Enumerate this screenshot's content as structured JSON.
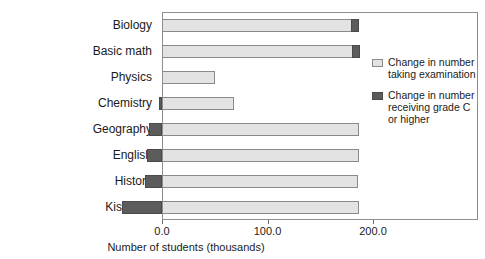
{
  "chart": {
    "type": "bar",
    "orientation": "horizontal",
    "title": "",
    "xlabel": "Number of students (thousands)",
    "ylabel": "",
    "xlim": [
      -45,
      200
    ],
    "xticks": [
      0.0,
      100.0,
      200.0
    ],
    "xtick_labels": [
      "0.0",
      "100.0",
      "200.0"
    ],
    "grid": false,
    "legend_position": "right",
    "categories": [
      "Biology",
      "Basic math",
      "Physics",
      "Chemistry",
      "Geography",
      "English",
      "History",
      "Kiswahili"
    ],
    "series": [
      {
        "name": "Change in number taking examination",
        "color": "#e3e3e3",
        "values": [
          187,
          188,
          50,
          68,
          187,
          187,
          186,
          187
        ]
      },
      {
        "name": "Change in number receiving grade C or higher",
        "color": "#5c5c5c",
        "values": [
          8,
          8,
          0,
          -3,
          -12,
          -14,
          -16,
          -38
        ]
      }
    ]
  },
  "chart_data": {
    "type": "bar",
    "orientation": "horizontal",
    "title": "",
    "xlabel": "Number of students (thousands)",
    "ylabel": "",
    "xlim": [
      -45,
      200
    ],
    "ylim": null,
    "xticks": [
      0.0,
      100.0,
      200.0
    ],
    "xtick_labels": [
      "0.0",
      "100.0",
      "200.0"
    ],
    "grid": false,
    "legend_position": "right",
    "categories": [
      "Biology",
      "Basic math",
      "Physics",
      "Chemistry",
      "Geography",
      "English",
      "History",
      "Kiswahili"
    ],
    "series": [
      {
        "name": "Change in number taking examination",
        "values": [
          187,
          188,
          50,
          68,
          187,
          187,
          186,
          187
        ]
      },
      {
        "name": "Change in number receiving grade C or higher",
        "values": [
          8,
          8,
          0,
          -3,
          -12,
          -14,
          -16,
          -38
        ]
      }
    ]
  },
  "legend": {
    "entries": [
      {
        "swatch": "light",
        "line1": "Change in number",
        "line2": "taking examination",
        "line3": ""
      },
      {
        "swatch": "dark",
        "line1": "Change in number",
        "line2": "receiving grade C",
        "line3": "or higher"
      }
    ]
  },
  "colors": {
    "series_light": "#e3e3e3",
    "series_dark": "#5c5c5c",
    "axis": "#8e8e8e",
    "text": "#1a1a1a"
  }
}
